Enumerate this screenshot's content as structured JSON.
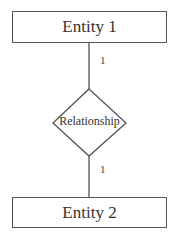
{
  "diagram": {
    "type": "entity-relationship",
    "entities": [
      {
        "label": "Entity 1"
      },
      {
        "label": "Entity 2"
      }
    ],
    "relationship": {
      "label": "Relationship"
    },
    "cardinalities": {
      "entity1_side": "1",
      "entity2_side": "1"
    },
    "colors": {
      "stroke": "#555555",
      "text": "#333333",
      "background": "#ffffff"
    }
  }
}
